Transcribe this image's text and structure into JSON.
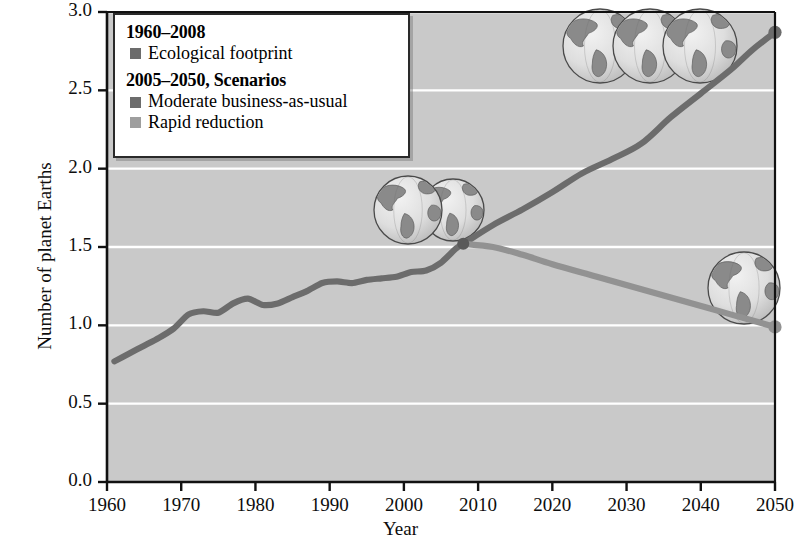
{
  "chart_data": {
    "type": "line",
    "title": "",
    "xlabel": "Year",
    "ylabel": "Number of planet Earths",
    "xlim": [
      1960,
      2050
    ],
    "ylim": [
      0.0,
      3.0
    ],
    "xticks": [
      1960,
      1970,
      1980,
      1990,
      2000,
      2010,
      2020,
      2030,
      2040,
      2050
    ],
    "yticks": [
      "0.0",
      "0.5",
      "1.0",
      "1.5",
      "2.0",
      "2.5",
      "3.0"
    ],
    "grid": "horizontal",
    "legend_position": "top-left",
    "plot_background": "#c9c9c9",
    "gridline_color": "#ffffff",
    "series": [
      {
        "name": "Ecological footprint",
        "period": "1960-2008",
        "color": "#6c6c6c",
        "x": [
          1961,
          1963,
          1965,
          1967,
          1969,
          1971,
          1973,
          1975,
          1977,
          1979,
          1981,
          1983,
          1985,
          1987,
          1989,
          1991,
          1993,
          1995,
          1997,
          1999,
          2001,
          2003,
          2005,
          2007,
          2008
        ],
        "values": [
          0.77,
          0.82,
          0.87,
          0.92,
          0.98,
          1.07,
          1.09,
          1.08,
          1.14,
          1.17,
          1.13,
          1.14,
          1.18,
          1.22,
          1.27,
          1.28,
          1.27,
          1.29,
          1.3,
          1.31,
          1.34,
          1.35,
          1.4,
          1.49,
          1.52
        ]
      },
      {
        "name": "Moderate business-as-usual",
        "period": "2005-2050",
        "color": "#6c6c6c",
        "x": [
          2008,
          2012,
          2016,
          2020,
          2024,
          2028,
          2032,
          2036,
          2040,
          2044,
          2047,
          2050
        ],
        "values": [
          1.52,
          1.64,
          1.74,
          1.85,
          1.97,
          2.06,
          2.16,
          2.33,
          2.48,
          2.63,
          2.76,
          2.87
        ],
        "endpoint_marker": true
      },
      {
        "name": "Rapid reduction",
        "period": "2005-2050",
        "color": "#929292",
        "x": [
          2008,
          2012,
          2016,
          2020,
          2026,
          2032,
          2038,
          2044,
          2050
        ],
        "values": [
          1.52,
          1.5,
          1.45,
          1.39,
          1.31,
          1.23,
          1.15,
          1.07,
          0.99
        ],
        "endpoint_marker": true
      }
    ],
    "annotations": [
      {
        "name": "globe-cluster-three-earths",
        "earths": 3,
        "x": 2032,
        "y": 2.72
      },
      {
        "name": "globe-cluster-one-and-half-earths",
        "earths": 1.5,
        "x": 2005,
        "y": 1.86
      },
      {
        "name": "globe-single-earth",
        "earths": 1,
        "x": 2046,
        "y": 1.2
      }
    ]
  },
  "legend": {
    "heading_1": "1960–2008",
    "items_1": [
      {
        "label": "Ecological footprint",
        "color": "#6c6c6c"
      }
    ],
    "heading_2": "2005–2050, Scenarios",
    "items_2": [
      {
        "label": "Moderate business-as-usual",
        "color": "#6c6c6c"
      },
      {
        "label": "Rapid reduction",
        "color": "#9e9e9e"
      }
    ]
  }
}
